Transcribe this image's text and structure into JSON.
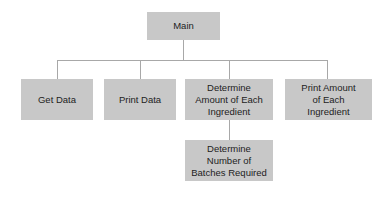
{
  "diagram": {
    "type": "hierarchy-chart",
    "root": {
      "label": "Main"
    },
    "level1": [
      {
        "label": "Get Data"
      },
      {
        "label": "Print Data"
      },
      {
        "label": "Determine Amount of Each Ingredient"
      },
      {
        "label": "Print Amount of Each Ingredient"
      }
    ],
    "level2": [
      {
        "label": "Determine Number of Batches Required",
        "parent": "Determine Amount of Each Ingredient"
      }
    ],
    "colors": {
      "box_fill": "#c8c8c8",
      "connector": "#a8a8a8",
      "text": "#222222",
      "background": "#ffffff"
    }
  }
}
